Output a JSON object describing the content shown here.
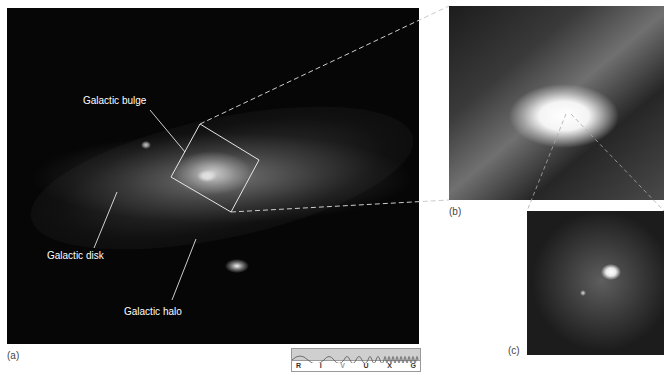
{
  "figure": {
    "panels": [
      {
        "id": "a",
        "caption": "(a)"
      },
      {
        "id": "b",
        "caption": "(b)"
      },
      {
        "id": "c",
        "caption": "(c)"
      }
    ],
    "labels": {
      "bulge": "Galactic bulge",
      "disk": "Galactic disk",
      "halo": "Galactic halo"
    },
    "spectrum_bar": {
      "bands": [
        "R",
        "I",
        "V",
        "U",
        "X",
        "G"
      ],
      "highlighted_band": "V"
    }
  }
}
